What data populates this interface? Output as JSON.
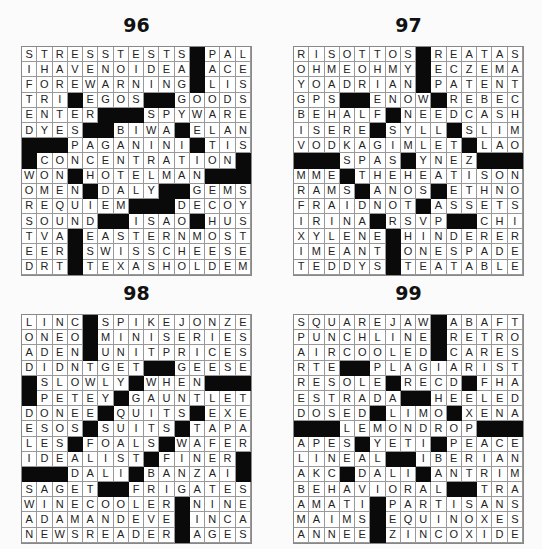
{
  "puzzles": [
    {
      "number": "96",
      "rows": [
        "STRESSTESTS#PAL",
        "IHAVENOIDEA#ACE",
        "FOREWARNING#LIS",
        "TRI#EGOS##GOODS",
        "ENTER###SPYWARE",
        "DYES##BIWA#ELAN",
        "###PAGANINI#TIS",
        "#CONCENTRATION#",
        "WON#HOTELMAN###",
        "OMEN#DALY##GEMS",
        "REQUIEM###DECOY",
        "SOUND##ISAO#HUS",
        "TVA#EASTERNMOST",
        "EER#SWISSCHEESE",
        "DRT#TEXASHOLDEM"
      ]
    },
    {
      "number": "97",
      "rows": [
        "RISOTTOS#REATAS",
        "OHMEOHMY#ECZEMA",
        "YOADRIAN#PATENT",
        "GPS##ENOW#REBEC",
        "BEHALF#NEEDCASH",
        "ISERE#SYLL#SLIM",
        "VODKAGIMLET#LAO",
        "###SPAS#YNEZ###",
        "MME#THEHEATISON",
        "RAMS#ANOS#ETHNO",
        "FRAIDNOT#ASSETS",
        "IRINA#RSVP##CHI",
        "XYLENE#HINDERER",
        "IMEANT#ONESPADE",
        "TEDDYS#TEATABLE"
      ]
    },
    {
      "number": "98",
      "rows": [
        "LINC#SPIKEJONZE",
        "ONEO#MINISERIES",
        "ADEN#UNITPRICES",
        "DIDNTGET##GEESE",
        "#SLOWLY#WHEN###",
        "#PETEY#GAUNTLET",
        "DONEE#QUITS#EXE",
        "ESOS#SUITS#TAPA",
        "LES#FOALS#WAFER",
        "IDEALIST#FINER#",
        "###DALI#BANZAI#",
        "SAGET##FRIGATES",
        "WINECOOLER#NINE",
        "ADAMANDEVE#INCA",
        "NEWSREADER#AGES"
      ]
    },
    {
      "number": "99",
      "rows": [
        "SQUAREJAW#ABAFT",
        "PUNCHLINE#RETRO",
        "AIRCOOLED#CARES",
        "RTE##PLAGIARIST",
        "RESOLE#RECD#FHA",
        "ESTRADA##HEELED",
        "DOSED#LIMO#XENA",
        "###LEMONDROP###",
        "APES#YETI#PEACE",
        "LINEAL##IBERIAN",
        "AKC#DALI#ANTRIM",
        "BEHAVIORAL##TRA",
        "AMATI#PARTISANS",
        "MAIMS#EQUINOXES",
        "ANNEE#ZINCOXIDE"
      ]
    }
  ],
  "colors": {
    "block": "#0a0a0a",
    "cell": "#ffffff",
    "line": "#999999",
    "background": "#fbfbfb"
  }
}
